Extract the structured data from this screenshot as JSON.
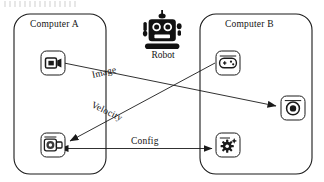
{
  "diagram": {
    "background_color": "#ffffff",
    "stroke_color": "#1a1a1a",
    "boxes": [
      {
        "id": "computer-a",
        "label": "Computer A",
        "x": 14,
        "y": 14,
        "width": 92,
        "height": 160
      },
      {
        "id": "computer-b",
        "label": "Computer B",
        "x": 200,
        "y": 14,
        "width": 112,
        "height": 160
      }
    ],
    "robot": {
      "label": "Robot",
      "icon": "robot-icon",
      "x": 149,
      "y": 8
    },
    "nodes": [
      {
        "id": "camera",
        "icon": "video-camera-icon",
        "parent": "computer-a",
        "x": 41,
        "y": 51,
        "size": 24
      },
      {
        "id": "motor",
        "icon": "motor-actuator-icon",
        "parent": "computer-a",
        "x": 41,
        "y": 133,
        "size": 24
      },
      {
        "id": "gamepad",
        "icon": "gamepad-icon",
        "parent": "computer-b",
        "x": 216,
        "y": 51,
        "size": 24
      },
      {
        "id": "display",
        "icon": "eye-display-icon",
        "parent": "computer-b",
        "x": 281,
        "y": 96,
        "size": 24
      },
      {
        "id": "config",
        "icon": "gear-settings-icon",
        "parent": "computer-b",
        "x": 216,
        "y": 133,
        "size": 24
      }
    ],
    "edges": [
      {
        "id": "image-edge",
        "label": "Image",
        "from": "camera",
        "to": "display",
        "direction": "one-way",
        "label_x": 92,
        "label_y": 76,
        "label_rotation": -13
      },
      {
        "id": "velocity-edge",
        "label": "Velocity",
        "from": "gamepad",
        "to": "motor",
        "direction": "one-way",
        "label_x": 92,
        "label_y": 105,
        "label_rotation": 26
      },
      {
        "id": "config-edge",
        "label": "Config",
        "from": "config",
        "to": "motor",
        "direction": "bidirectional",
        "label_x": 131,
        "label_y": 137,
        "label_rotation": 0
      }
    ]
  }
}
